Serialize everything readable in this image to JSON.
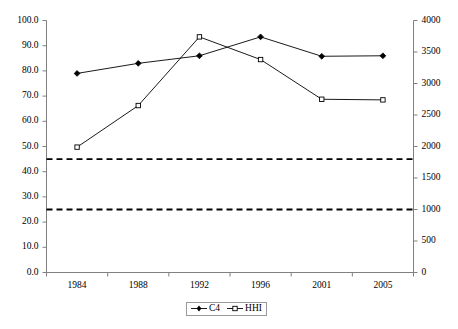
{
  "chart_data": {
    "type": "line",
    "title": "",
    "xlabel": "",
    "ylabel": "",
    "categories": [
      "1984",
      "1988",
      "1992",
      "1996",
      "2001",
      "2005"
    ],
    "series": [
      {
        "name": "C4",
        "axis": "left",
        "marker": "filled-diamond",
        "values": [
          79.0,
          83.0,
          86.0,
          93.5,
          85.8,
          86.0
        ]
      },
      {
        "name": "HHI",
        "axis": "right",
        "marker": "open-square",
        "values": [
          1990,
          2650,
          3740,
          3380,
          2750,
          2740
        ]
      }
    ],
    "reference_lines": [
      {
        "name": "upper-threshold",
        "axis": "right",
        "value": 1800,
        "style": "dashed"
      },
      {
        "name": "lower-threshold",
        "axis": "right",
        "value": 1000,
        "style": "dashed"
      }
    ],
    "left_axis": {
      "min": 0,
      "max": 100,
      "step": 10,
      "ticks": [
        "0.0",
        "10.0",
        "20.0",
        "30.0",
        "40.0",
        "50.0",
        "60.0",
        "70.0",
        "80.0",
        "90.0",
        "100.0"
      ]
    },
    "right_axis": {
      "min": 0,
      "max": 4000,
      "step": 500,
      "ticks": [
        "0",
        "500",
        "1000",
        "1500",
        "2000",
        "2500",
        "3000",
        "3500",
        "4000"
      ]
    },
    "legend": {
      "position": "bottom-center",
      "entries": [
        "C4",
        "HHI"
      ]
    },
    "grid": false,
    "colors": {
      "series_line": "#000000",
      "axis": "#808080",
      "reference_line": "#000000",
      "legend_border": "#9a9a9a"
    }
  }
}
